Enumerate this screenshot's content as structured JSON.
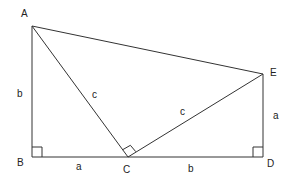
{
  "diagram": {
    "colors": {
      "stroke": "#333333",
      "text": "#222222",
      "background": "#ffffff"
    },
    "points": {
      "A": {
        "label": "A",
        "x": 32,
        "y": 26
      },
      "B": {
        "label": "B",
        "x": 32,
        "y": 157
      },
      "C": {
        "label": "C",
        "x": 128,
        "y": 157
      },
      "D": {
        "label": "D",
        "x": 263,
        "y": 157
      },
      "E": {
        "label": "E",
        "x": 263,
        "y": 74
      }
    },
    "segments": [
      {
        "from": "A",
        "to": "B",
        "label": "b"
      },
      {
        "from": "B",
        "to": "C",
        "label": "a"
      },
      {
        "from": "C",
        "to": "D",
        "label": "b"
      },
      {
        "from": "D",
        "to": "E",
        "label": "a"
      },
      {
        "from": "A",
        "to": "C",
        "label": "c"
      },
      {
        "from": "C",
        "to": "E",
        "label": "c"
      },
      {
        "from": "A",
        "to": "E",
        "label": ""
      }
    ],
    "right_angles": [
      "B",
      "C",
      "D"
    ],
    "vertex_labels": {
      "A": "A",
      "B": "B",
      "C": "C",
      "D": "D",
      "E": "E"
    },
    "side_labels": {
      "AB": "b",
      "BC": "a",
      "CD": "b",
      "DE": "a",
      "AC": "c",
      "CE": "c"
    }
  }
}
